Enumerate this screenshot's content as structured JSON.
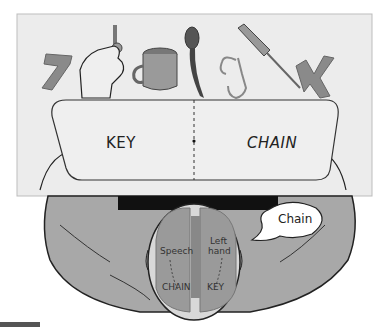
{
  "figure": {
    "type": "split-brain experiment illustration",
    "objects": [
      "number-7",
      "hand-holding-key",
      "mug",
      "spoon",
      "chain",
      "screwdriver",
      "letter-K"
    ],
    "screen": {
      "left_word": "KEY",
      "right_word": "CHAIN"
    },
    "brain": {
      "left_hemisphere_label": "Speech",
      "left_hemisphere_word": "CHAIN",
      "right_hemisphere_label_line1": "Left",
      "right_hemisphere_label_line2": "hand",
      "right_hemisphere_word": "KEY"
    },
    "speech_bubble": "Chain",
    "colors": {
      "background_panel": "#ececec",
      "screen": "#efefef",
      "skin": "#a8a8a8",
      "brain": "#9a9a9a",
      "outline": "#222222"
    }
  }
}
